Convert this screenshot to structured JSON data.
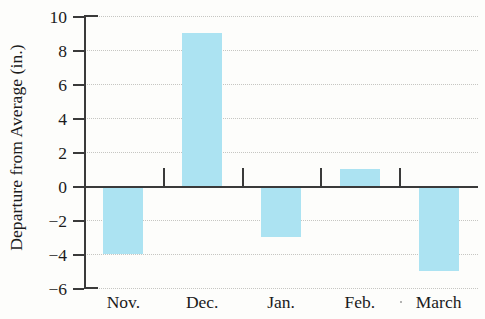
{
  "chart_data": {
    "type": "bar",
    "title": "",
    "xlabel": "",
    "ylabel": "Departure from Average (in.)",
    "categories": [
      "Nov.",
      "Dec.",
      "Jan.",
      "Feb.",
      "March"
    ],
    "values": [
      -4,
      9,
      -3,
      1,
      -5
    ],
    "series": [
      {
        "name": "Departure from Average",
        "values": [
          -4,
          9,
          -3,
          1,
          -5
        ]
      }
    ],
    "ylim": [
      -6,
      10
    ],
    "ytick_labels": [
      "10",
      "8",
      "6",
      "4",
      "2",
      "0",
      "−2",
      "−4",
      "−6"
    ],
    "ytick_values": [
      10,
      8,
      6,
      4,
      2,
      0,
      -2,
      -4,
      -6
    ],
    "grid": true,
    "legend": "none",
    "bar_color": "#ACE3F2",
    "axis_color": "#3A3A3A",
    "grid_color": "#C6C6C2",
    "background_color": "#FDFDFB",
    "units": "in."
  }
}
